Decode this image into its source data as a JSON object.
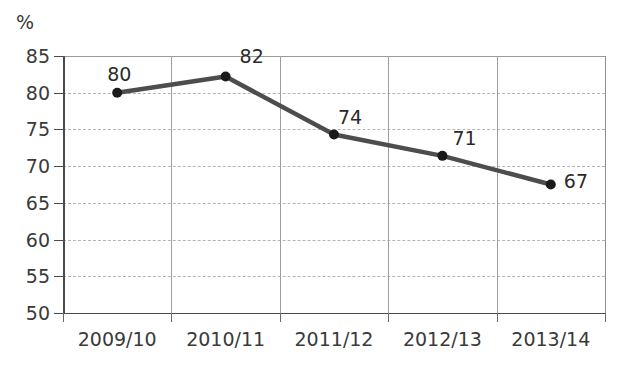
{
  "chart_data": {
    "type": "line",
    "title": "",
    "subtitle": "",
    "xlabel": "",
    "ylabel": "%",
    "unit_label": "%",
    "categories": [
      "2009/10",
      "2010/11",
      "2011/12",
      "2012/13",
      "2013/14"
    ],
    "values": [
      80.0,
      82.2,
      74.3,
      71.4,
      67.5
    ],
    "data_labels": [
      "80",
      "82",
      "74",
      "71",
      "67"
    ],
    "ylim": [
      50,
      85
    ],
    "ytick_step": 5,
    "ytick_labels": [
      "85",
      "80",
      "75",
      "70",
      "65",
      "60",
      "55",
      "50"
    ],
    "ytick_values": [
      85,
      80,
      75,
      70,
      65,
      60,
      55,
      50
    ],
    "grid": {
      "horizontal": true,
      "horizontal_style": "dashed",
      "vertical": true,
      "vertical_style": "solid"
    },
    "legend": "none",
    "series": [
      {
        "name": "",
        "values": [
          80.0,
          82.2,
          74.3,
          71.4,
          67.5
        ],
        "line_color": "#4d4d4d",
        "marker_color": "#1a1a1a",
        "line_width": 4.5,
        "marker_radius": 5
      }
    ],
    "colors": {
      "line": "#4d4d4d",
      "marker": "#1a1a1a",
      "grid": "#b4b4b4",
      "axis": "#4a4a4a",
      "text": "#3a3a3a",
      "background": "#ffffff"
    }
  }
}
